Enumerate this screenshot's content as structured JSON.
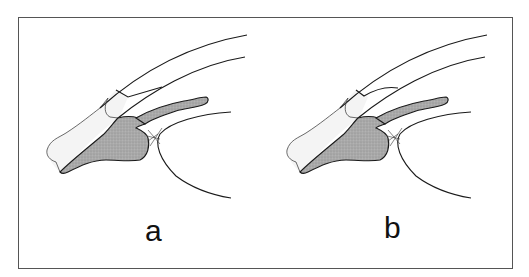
{
  "figure": {
    "panels": [
      {
        "id": "a",
        "label": "a",
        "notch_shape": "angular"
      },
      {
        "id": "b",
        "label": "b",
        "notch_shape": "rounded"
      }
    ],
    "colors": {
      "outline": "#1a1a1a",
      "shaded_tissue": "#a9a9a9",
      "pale_strip": "#f2f2f2",
      "frame": "#555555",
      "background": "#ffffff"
    }
  }
}
